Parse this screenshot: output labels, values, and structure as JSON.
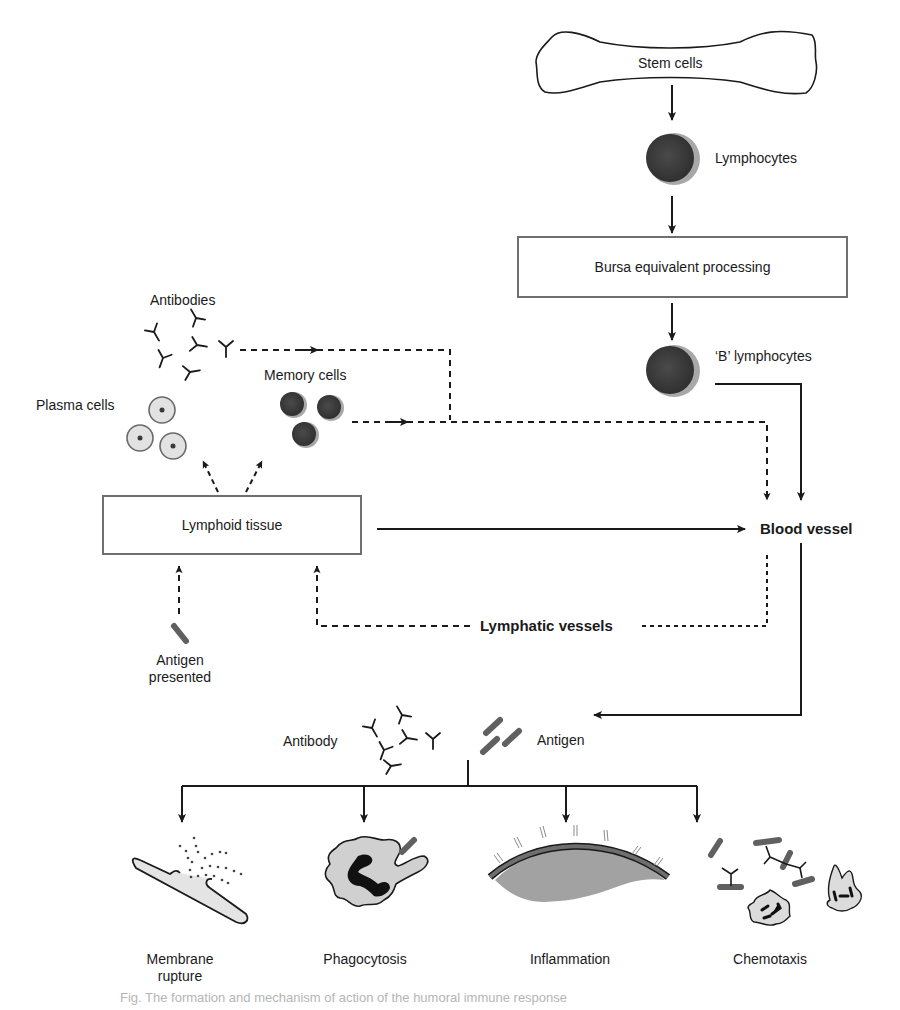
{
  "diagram": {
    "nodes": {
      "stem_cells": "Stem cells",
      "lymphocytes": "Lymphocytes",
      "bursa": "Bursa equivalent processing",
      "b_lymphocytes": "‘B’ lymphocytes",
      "antibodies": "Antibodies",
      "memory_cells": "Memory cells",
      "plasma_cells": "Plasma cells",
      "lymphoid_tissue": "Lymphoid tissue",
      "blood_vessel": "Blood vessel",
      "lymphatic_vessels": "Lymphatic vessels",
      "antigen_presented_line1": "Antigen",
      "antigen_presented_line2": "presented",
      "antibody": "Antibody",
      "antigen": "Antigen"
    },
    "outcomes": [
      {
        "label_line1": "Membrane",
        "label_line2": "rupture",
        "icon": "membrane-rupture-icon"
      },
      {
        "label_line1": "Phagocytosis",
        "label_line2": "",
        "icon": "phagocytosis-icon"
      },
      {
        "label_line1": "Inflammation",
        "label_line2": "",
        "icon": "inflammation-icon"
      },
      {
        "label_line1": "Chemotaxis",
        "label_line2": "",
        "icon": "chemotaxis-icon"
      }
    ],
    "edges": [
      {
        "from": "Stem cells",
        "to": "Lymphocytes",
        "style": "solid"
      },
      {
        "from": "Lymphocytes",
        "to": "Bursa equivalent processing",
        "style": "solid"
      },
      {
        "from": "Bursa equivalent processing",
        "to": "‘B’ lymphocytes",
        "style": "solid"
      },
      {
        "from": "‘B’ lymphocytes",
        "to": "Blood vessel",
        "style": "solid"
      },
      {
        "from": "Antibodies",
        "to": "Blood vessel",
        "style": "dashed"
      },
      {
        "from": "Memory cells",
        "to": "Blood vessel",
        "style": "dashed"
      },
      {
        "from": "Lymphoid tissue",
        "to": "Plasma cells",
        "style": "dashed"
      },
      {
        "from": "Lymphoid tissue",
        "to": "Memory cells",
        "style": "dashed"
      },
      {
        "from": "Lymphoid tissue",
        "to": "Blood vessel",
        "style": "solid"
      },
      {
        "from": "Blood vessel",
        "to": "Lymphoid tissue",
        "style": "dashed",
        "via": "Lymphatic vessels"
      },
      {
        "from": "Antigen presented",
        "to": "Lymphoid tissue",
        "style": "dashed"
      },
      {
        "from": "Blood vessel",
        "to": "Antibody + Antigen",
        "style": "solid"
      },
      {
        "from": "Antibody + Antigen",
        "to": "Membrane rupture",
        "style": "solid"
      },
      {
        "from": "Antibody + Antigen",
        "to": "Phagocytosis",
        "style": "solid"
      },
      {
        "from": "Antibody + Antigen",
        "to": "Inflammation",
        "style": "solid"
      },
      {
        "from": "Antibody + Antigen",
        "to": "Chemotaxis",
        "style": "solid"
      }
    ],
    "caption": "Fig. The formation and mechanism of action of the humoral immune response"
  },
  "colors": {
    "line": "#1a1a1a",
    "box_border": "#6f6f6f",
    "cell_dark": "#3a3a3a",
    "cell_rim": "#a8a8a8",
    "plasma_fill": "#e2e2e2",
    "antigen": "#606060",
    "inflammation_fill": "#9a9a9a"
  }
}
